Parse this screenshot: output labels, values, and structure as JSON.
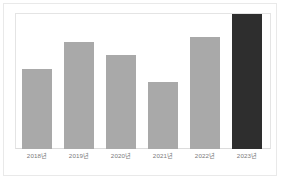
{
  "chart_data": {
    "type": "bar",
    "title": "",
    "subtitle": "",
    "xlabel": "",
    "ylabel": "",
    "categories": [
      "2018년",
      "2019년",
      "2020년",
      "2021년",
      "2022년",
      "2023년"
    ],
    "values": [
      59,
      79,
      70,
      50,
      83,
      100
    ],
    "ylim": [
      0,
      100
    ],
    "grid": false,
    "legend": false,
    "legend_position": "none",
    "bar_colors": [
      "#a9a9a9",
      "#a9a9a9",
      "#a9a9a9",
      "#a9a9a9",
      "#a9a9a9",
      "#2e2e2e"
    ],
    "highlight_index": 5,
    "axis_tick_labels_shown": true,
    "y_tick_labels": []
  },
  "colors": {
    "bar_default": "#a9a9a9",
    "bar_highlight": "#2e2e2e",
    "plot_border": "#e4e4e4",
    "card_border": "#e9e9e9",
    "label_text": "#7a7a7a",
    "background": "#ffffff"
  }
}
